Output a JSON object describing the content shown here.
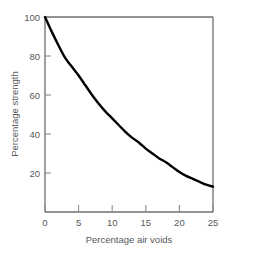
{
  "chart_data": {
    "type": "line",
    "title": "",
    "xlabel": "Percentage air voids",
    "ylabel": "Percentage strength",
    "xlim": [
      0,
      25
    ],
    "ylim": [
      0,
      100
    ],
    "xticks": [
      0,
      5,
      10,
      15,
      20,
      25
    ],
    "xticklabels": [
      "0",
      "5",
      "10",
      "15",
      "20",
      "25"
    ],
    "yticks": [
      20,
      40,
      60,
      80,
      100
    ],
    "yticklabels": [
      "20",
      "40",
      "60",
      "80",
      "100"
    ],
    "grid": false,
    "legend": null,
    "series": [
      {
        "name": "Percentage strength",
        "color": "#000000",
        "linewidth": 2.4,
        "x": [
          0,
          1,
          2,
          3,
          4,
          5,
          6,
          7,
          8,
          9,
          10,
          11,
          12,
          13,
          14,
          15,
          16,
          17,
          18,
          19,
          20,
          21,
          22,
          23,
          24,
          25
        ],
        "y": [
          100,
          92.5,
          85.5,
          79,
          74.5,
          70,
          65,
          60,
          55.5,
          51.5,
          48,
          44.5,
          41,
          38,
          35.5,
          32.5,
          30,
          27.5,
          25.5,
          23,
          20.5,
          18.5,
          17,
          15.5,
          14,
          13
        ]
      }
    ]
  },
  "style": {
    "frame_color": "#6d6e71",
    "tick_color": "#8a8b8d",
    "text_color": "#58585a",
    "curve_color": "#000000",
    "background": "#ffffff"
  }
}
